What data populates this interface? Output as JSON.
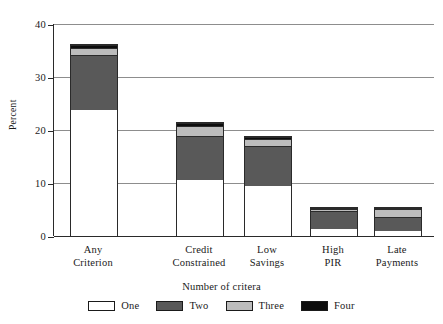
{
  "chart_data": {
    "type": "bar",
    "subtype": "stacked-bar",
    "title": "",
    "xlabel": "Number of critera",
    "ylabel": "Percent",
    "ylim": [
      0,
      40
    ],
    "yticks": [
      0,
      10,
      20,
      30,
      40
    ],
    "ytick_labels": [
      "0",
      "10",
      "20",
      "30",
      "40"
    ],
    "grid": true,
    "legend_position": "bottom",
    "categories": [
      "Any\nCriterion",
      "Credit\nConstrained",
      "Low\nSavings",
      "High\nPIR",
      "Late\nPayments"
    ],
    "series": [
      {
        "name": "One",
        "color": "#ffffff",
        "values": [
          23.9,
          10.7,
          9.6,
          1.4,
          1.0
        ]
      },
      {
        "name": "Two",
        "color": "#595959",
        "values": [
          10.4,
          8.3,
          7.5,
          3.5,
          2.7
        ]
      },
      {
        "name": "Three",
        "color": "#bcbcbc",
        "values": [
          1.4,
          2.0,
          1.4,
          0.4,
          1.5
        ]
      },
      {
        "name": "Four",
        "color": "#0d0d0d",
        "values": [
          0.6,
          0.5,
          0.4,
          0.2,
          0.3
        ]
      }
    ],
    "totals": [
      36.3,
      21.5,
      18.9,
      5.5,
      5.5
    ]
  },
  "axis": {
    "y_title": "Percent",
    "x_title": "Number of critera",
    "tick_0": "0",
    "tick_10": "10",
    "tick_20": "20",
    "tick_30": "30",
    "tick_40": "40"
  },
  "categories": [
    {
      "label": "Any\nCriterion"
    },
    {
      "label": "Credit\nConstrained"
    },
    {
      "label": "Low\nSavings"
    },
    {
      "label": "High\nPIR"
    },
    {
      "label": "Late\nPayments"
    }
  ],
  "legend": {
    "items": [
      {
        "label": "One",
        "color": "#ffffff"
      },
      {
        "label": "Two",
        "color": "#595959"
      },
      {
        "label": "Three",
        "color": "#bcbcbc"
      },
      {
        "label": "Four",
        "color": "#0d0d0d"
      }
    ]
  }
}
